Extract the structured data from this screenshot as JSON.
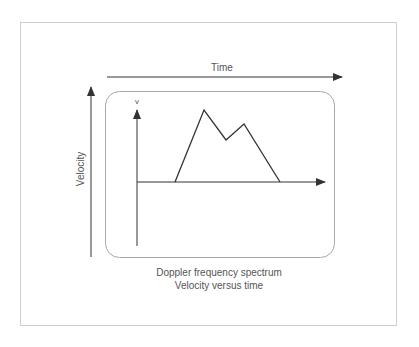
{
  "labels": {
    "time_axis": "Time",
    "velocity_axis": "Velocity",
    "inner_axis": "v",
    "caption_line1": "Doppler frequency spectrum",
    "caption_line2": "Velocity versus time"
  },
  "colors": {
    "frame": "#cfcfcf",
    "box": "#a8a8a8",
    "line": "#333333",
    "text": "#555555"
  },
  "waveform": {
    "points": [
      [
        175,
        182
      ],
      [
        204,
        110
      ],
      [
        226,
        140
      ],
      [
        244,
        124
      ],
      [
        280,
        182
      ]
    ]
  }
}
